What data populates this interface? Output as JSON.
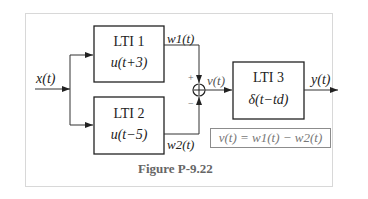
{
  "figure": {
    "caption": "Figure P-9.22",
    "input_label": "x(t)",
    "output_label": "y(t)",
    "blocks": [
      {
        "name": "LTI 1",
        "impulse_response": "u(t+3)",
        "output_label": "w1(t)"
      },
      {
        "name": "LTI 2",
        "impulse_response": "u(t−5)",
        "output_label": "w2(t)"
      },
      {
        "name": "LTI 3",
        "impulse_response": "δ(t−td)"
      }
    ],
    "summer": {
      "plus_sign": "+",
      "minus_sign": "−",
      "output_label": "v(t)"
    },
    "equation": "v(t) = w1(t) − w2(t)",
    "colors": {
      "line": "#222222",
      "frame": "#d8d8d8",
      "equation_text": "#777777"
    }
  }
}
